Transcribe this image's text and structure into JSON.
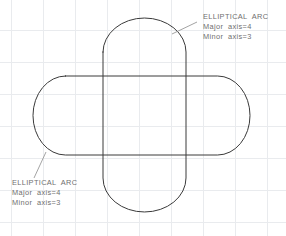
{
  "drawing": {
    "title": "elliptical-arc-slot-construction",
    "background_color": "#ffffff",
    "grid": {
      "color": "#e9ebee",
      "spacing": 32,
      "origin_x": 11,
      "origin_y": 30,
      "vertical_lines": [
        11,
        43,
        75,
        107,
        139,
        171,
        203,
        235,
        267
      ],
      "horizontal_lines": [
        30,
        62,
        94,
        126,
        158,
        190,
        222
      ]
    },
    "outline_color": "#3a3a3a",
    "leader_color": "#8c8c8c",
    "text_color": "#6f6f6f",
    "shapes": [
      {
        "name": "horizontal-slot",
        "type": "stadium",
        "orientation": "horizontal",
        "left": 33,
        "top": 76,
        "right": 250,
        "bottom": 155
      },
      {
        "name": "vertical-slot",
        "type": "stadium",
        "orientation": "vertical",
        "left": 103,
        "top": 18,
        "right": 186,
        "bottom": 212
      }
    ]
  },
  "annotations": [
    {
      "id": "annotation-top-right",
      "title": "ELLIPTICAL  ARC",
      "major_axis": "Major  axis=4",
      "minor_axis": "Minor  axis=3",
      "text_x": 203,
      "text_y": 19,
      "leader_points": "172,34 197,22"
    },
    {
      "id": "annotation-bottom-left",
      "title": "ELLIPTICAL  ARC",
      "major_axis": "Major  axis=4",
      "minor_axis": "Minor  axis=3",
      "text_x": 12,
      "text_y": 185,
      "leader_points": "46,152 34,178"
    }
  ]
}
